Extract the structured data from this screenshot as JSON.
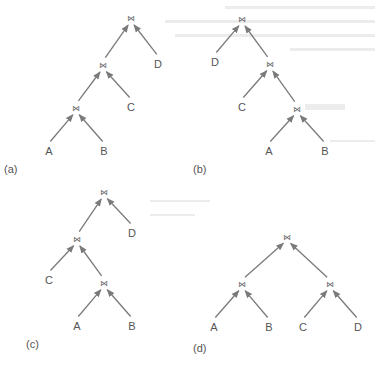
{
  "figure": {
    "join_symbol": "⋈",
    "colors": {
      "edge": "#7a7a7a",
      "text": "#555555",
      "background": "#ffffff"
    },
    "trees": [
      {
        "id": "a",
        "caption": "(a)",
        "caption_pos": [
          4,
          173
        ],
        "nodes": [
          {
            "id": "j1",
            "type": "join",
            "x": 131,
            "y": 18
          },
          {
            "id": "j2",
            "type": "join",
            "x": 103,
            "y": 65
          },
          {
            "id": "D",
            "type": "relation",
            "label": "D",
            "x": 158,
            "y": 68
          },
          {
            "id": "j3",
            "type": "join",
            "x": 76,
            "y": 108
          },
          {
            "id": "C",
            "type": "relation",
            "label": "C",
            "x": 131,
            "y": 111
          },
          {
            "id": "A",
            "type": "relation",
            "label": "A",
            "x": 49,
            "y": 155
          },
          {
            "id": "B",
            "type": "relation",
            "label": "B",
            "x": 104,
            "y": 155
          }
        ],
        "edges": [
          [
            "j2",
            "j1"
          ],
          [
            "D",
            "j1"
          ],
          [
            "j3",
            "j2"
          ],
          [
            "C",
            "j2"
          ],
          [
            "A",
            "j3"
          ],
          [
            "B",
            "j3"
          ]
        ]
      },
      {
        "id": "b",
        "caption": "(b)",
        "caption_pos": [
          193,
          173
        ],
        "nodes": [
          {
            "id": "j1",
            "type": "join",
            "x": 242,
            "y": 19
          },
          {
            "id": "D",
            "type": "relation",
            "label": "D",
            "x": 215,
            "y": 66
          },
          {
            "id": "j2",
            "type": "join",
            "x": 270,
            "y": 64
          },
          {
            "id": "C",
            "type": "relation",
            "label": "C",
            "x": 242,
            "y": 111
          },
          {
            "id": "j3",
            "type": "join",
            "x": 297,
            "y": 109
          },
          {
            "id": "A",
            "type": "relation",
            "label": "A",
            "x": 269,
            "y": 155
          },
          {
            "id": "B",
            "type": "relation",
            "label": "B",
            "x": 325,
            "y": 155
          }
        ],
        "edges": [
          [
            "D",
            "j1"
          ],
          [
            "j2",
            "j1"
          ],
          [
            "C",
            "j2"
          ],
          [
            "j3",
            "j2"
          ],
          [
            "A",
            "j3"
          ],
          [
            "B",
            "j3"
          ]
        ]
      },
      {
        "id": "c",
        "caption": "(c)",
        "caption_pos": [
          26,
          348
        ],
        "nodes": [
          {
            "id": "j1",
            "type": "join",
            "x": 104,
            "y": 192
          },
          {
            "id": "j2",
            "type": "join",
            "x": 77,
            "y": 239
          },
          {
            "id": "D",
            "type": "relation",
            "label": "D",
            "x": 132,
            "y": 237
          },
          {
            "id": "C",
            "type": "relation",
            "label": "C",
            "x": 49,
            "y": 284
          },
          {
            "id": "j3",
            "type": "join",
            "x": 104,
            "y": 283
          },
          {
            "id": "A",
            "type": "relation",
            "label": "A",
            "x": 77,
            "y": 330
          },
          {
            "id": "B",
            "type": "relation",
            "label": "B",
            "x": 132,
            "y": 330
          }
        ],
        "edges": [
          [
            "j2",
            "j1"
          ],
          [
            "D",
            "j1"
          ],
          [
            "C",
            "j2"
          ],
          [
            "j3",
            "j2"
          ],
          [
            "A",
            "j3"
          ],
          [
            "B",
            "j3"
          ]
        ]
      },
      {
        "id": "d",
        "caption": "(d)",
        "caption_pos": [
          193,
          352
        ],
        "nodes": [
          {
            "id": "j1",
            "type": "join",
            "x": 287,
            "y": 237
          },
          {
            "id": "jl",
            "type": "join",
            "x": 242,
            "y": 284
          },
          {
            "id": "jr",
            "type": "join",
            "x": 330,
            "y": 284
          },
          {
            "id": "A",
            "type": "relation",
            "label": "A",
            "x": 214,
            "y": 331
          },
          {
            "id": "B",
            "type": "relation",
            "label": "B",
            "x": 269,
            "y": 331
          },
          {
            "id": "C",
            "type": "relation",
            "label": "C",
            "x": 303,
            "y": 331
          },
          {
            "id": "D",
            "type": "relation",
            "label": "D",
            "x": 358,
            "y": 331
          }
        ],
        "edges": [
          [
            "jl",
            "j1"
          ],
          [
            "jr",
            "j1"
          ],
          [
            "A",
            "jl"
          ],
          [
            "B",
            "jl"
          ],
          [
            "C",
            "jr"
          ],
          [
            "D",
            "jr"
          ]
        ]
      }
    ]
  }
}
